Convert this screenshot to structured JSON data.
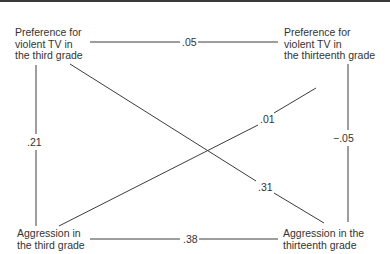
{
  "diagram": {
    "type": "cross-lagged correlation diagram",
    "nodes": {
      "top_left": {
        "lines": [
          "Preference for",
          "violent TV in",
          "the third grade"
        ]
      },
      "top_right": {
        "lines": [
          "Preference for",
          "violent TV in",
          "the thirteenth grade"
        ]
      },
      "bottom_left": {
        "lines": [
          "Aggression in",
          "the third grade"
        ]
      },
      "bottom_right": {
        "lines": [
          "Aggression in the",
          "thirteenth grade"
        ]
      }
    },
    "edges": {
      "top": {
        "from": "top_left",
        "to": "top_right",
        "label": ".05"
      },
      "bottom": {
        "from": "bottom_left",
        "to": "bottom_right",
        "label": ".38"
      },
      "left": {
        "from": "top_left",
        "to": "bottom_left",
        "label": ".21"
      },
      "right": {
        "from": "top_right",
        "to": "bottom_right",
        "label": "−.05"
      },
      "diag_tl_br": {
        "from": "top_left",
        "to": "bottom_right",
        "label": ".31"
      },
      "diag_bl_tr": {
        "from": "bottom_left",
        "to": "top_right",
        "label": ".01"
      }
    },
    "line_color": "#3c3c3c"
  }
}
